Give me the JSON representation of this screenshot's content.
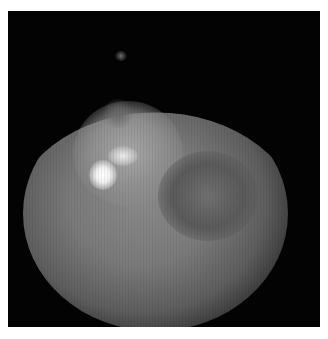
{
  "image": {
    "description": "Grayscale fluorescence microscopy image of a rounded cell-like mass on black background",
    "background_color": "#030303",
    "border_color": "#ffffff"
  }
}
